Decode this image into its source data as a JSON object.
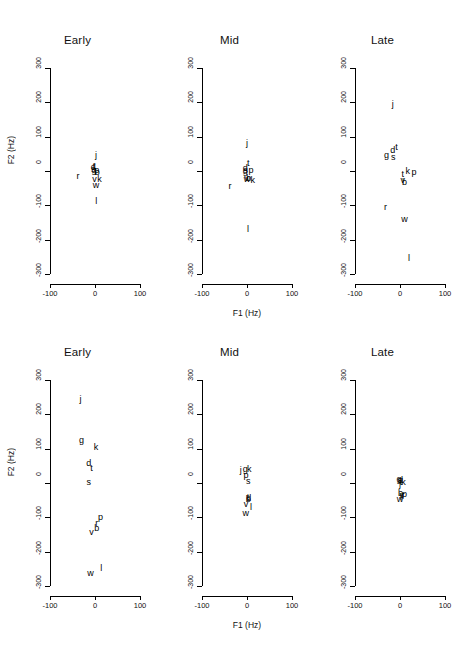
{
  "figure": {
    "axis": {
      "xlabel": "F1 (Hz)",
      "ylabel": "F2 (Hz)",
      "xticks": [
        "-100",
        "0",
        "100"
      ],
      "xtick_values": [
        -100,
        0,
        100
      ],
      "yticks": [
        "300",
        "200",
        "100",
        "0",
        "-100",
        "-200",
        "-300"
      ],
      "ytick_values": [
        300,
        200,
        100,
        0,
        -100,
        -200,
        -300
      ],
      "xlim": [
        -100,
        100
      ],
      "ylim": [
        -300,
        300
      ]
    }
  },
  "chart_data": [
    {
      "type": "scatter",
      "title": "Early",
      "row": 0,
      "col": 0,
      "xlabel": "F1 (Hz)",
      "ylabel": "F2 (Hz)",
      "xlim": [
        -100,
        100
      ],
      "ylim": [
        -300,
        300
      ],
      "grid": false,
      "marker_style": "text-label",
      "points": [
        {
          "label": "j",
          "x": 2,
          "y": 48
        },
        {
          "label": "d",
          "x": -4,
          "y": 12
        },
        {
          "label": "t",
          "x": -2,
          "y": 16
        },
        {
          "label": "s",
          "x": -4,
          "y": 6
        },
        {
          "label": "g",
          "x": -2,
          "y": 4
        },
        {
          "label": "p",
          "x": 4,
          "y": 2
        },
        {
          "label": "b",
          "x": 5,
          "y": -2
        },
        {
          "label": "r",
          "x": -38,
          "y": -16
        },
        {
          "label": "v",
          "x": -1,
          "y": -22
        },
        {
          "label": "k",
          "x": 10,
          "y": -24
        },
        {
          "label": "w",
          "x": 2,
          "y": -40
        },
        {
          "label": "l",
          "x": 3,
          "y": -88
        }
      ]
    },
    {
      "type": "scatter",
      "title": "Mid",
      "row": 0,
      "col": 1,
      "xlabel": "F1 (Hz)",
      "ylabel": "F2 (Hz)",
      "xlim": [
        -100,
        100
      ],
      "ylim": [
        -300,
        300
      ],
      "grid": false,
      "marker_style": "text-label",
      "points": [
        {
          "label": "j",
          "x": 0,
          "y": 82
        },
        {
          "label": "t",
          "x": 3,
          "y": 22
        },
        {
          "label": "d",
          "x": -4,
          "y": 10
        },
        {
          "label": "s",
          "x": -3,
          "y": 4
        },
        {
          "label": "g",
          "x": -4,
          "y": 0
        },
        {
          "label": "p",
          "x": 9,
          "y": 2
        },
        {
          "label": "v",
          "x": -1,
          "y": -20
        },
        {
          "label": "b",
          "x": 4,
          "y": -20
        },
        {
          "label": "k",
          "x": 13,
          "y": -26
        },
        {
          "label": "w",
          "x": 0,
          "y": -22
        },
        {
          "label": "r",
          "x": -38,
          "y": -44
        },
        {
          "label": "l",
          "x": 2,
          "y": -170
        }
      ]
    },
    {
      "type": "scatter",
      "title": "Late",
      "row": 0,
      "col": 2,
      "xlabel": "F1 (Hz)",
      "ylabel": "F2 (Hz)",
      "xlim": [
        -100,
        100
      ],
      "ylim": [
        -300,
        300
      ],
      "grid": false,
      "marker_style": "text-label",
      "points": [
        {
          "label": "j",
          "x": -16,
          "y": 196
        },
        {
          "label": "g",
          "x": -30,
          "y": 48
        },
        {
          "label": "d",
          "x": -16,
          "y": 60
        },
        {
          "label": "t",
          "x": -8,
          "y": 70
        },
        {
          "label": "s",
          "x": -15,
          "y": 40
        },
        {
          "label": "t",
          "x": 6,
          "y": -8
        },
        {
          "label": "k",
          "x": 17,
          "y": 0
        },
        {
          "label": "p",
          "x": 31,
          "y": -2
        },
        {
          "label": "b",
          "x": 10,
          "y": -32
        },
        {
          "label": "v",
          "x": 6,
          "y": -26
        },
        {
          "label": "r",
          "x": -32,
          "y": -104
        },
        {
          "label": "w",
          "x": 10,
          "y": -140
        },
        {
          "label": "l",
          "x": 20,
          "y": -252
        }
      ]
    },
    {
      "type": "scatter",
      "title": "Early",
      "row": 1,
      "col": 0,
      "xlabel": "F1 (Hz)",
      "ylabel": "F2 (Hz)",
      "xlim": [
        -100,
        100
      ],
      "ylim": [
        -300,
        300
      ],
      "grid": false,
      "marker_style": "text-label",
      "points": [
        {
          "label": "j",
          "x": -32,
          "y": 244
        },
        {
          "label": "g",
          "x": -30,
          "y": 124
        },
        {
          "label": "k",
          "x": 2,
          "y": 104
        },
        {
          "label": "d",
          "x": -14,
          "y": 58
        },
        {
          "label": "t",
          "x": -8,
          "y": 44
        },
        {
          "label": "s",
          "x": -14,
          "y": 2
        },
        {
          "label": "p",
          "x": 12,
          "y": -100
        },
        {
          "label": "r",
          "x": 4,
          "y": -116
        },
        {
          "label": "b",
          "x": 4,
          "y": -130
        },
        {
          "label": "v",
          "x": -8,
          "y": -144
        },
        {
          "label": "w",
          "x": -10,
          "y": -262
        },
        {
          "label": "l",
          "x": 14,
          "y": -248
        }
      ]
    },
    {
      "type": "scatter",
      "title": "Mid",
      "row": 1,
      "col": 1,
      "xlabel": "F1 (Hz)",
      "ylabel": "F2 (Hz)",
      "xlim": [
        -100,
        100
      ],
      "ylim": [
        -300,
        300
      ],
      "grid": false,
      "marker_style": "text-label",
      "points": [
        {
          "label": "j",
          "x": -14,
          "y": 38
        },
        {
          "label": "g",
          "x": -4,
          "y": 42
        },
        {
          "label": "k",
          "x": 5,
          "y": 42
        },
        {
          "label": "p",
          "x": -2,
          "y": 24
        },
        {
          "label": "s",
          "x": 3,
          "y": 6
        },
        {
          "label": "t",
          "x": 2,
          "y": -42
        },
        {
          "label": "d",
          "x": 4,
          "y": -44
        },
        {
          "label": "b",
          "x": 3,
          "y": -48
        },
        {
          "label": "v",
          "x": -2,
          "y": -62
        },
        {
          "label": "l",
          "x": 9,
          "y": -70
        },
        {
          "label": "w",
          "x": -3,
          "y": -88
        }
      ]
    },
    {
      "type": "scatter",
      "title": "Late",
      "row": 1,
      "col": 2,
      "xlabel": "F1 (Hz)",
      "ylabel": "F2 (Hz)",
      "xlim": [
        -100,
        100
      ],
      "ylim": [
        -300,
        300
      ],
      "grid": false,
      "marker_style": "text-label",
      "points": [
        {
          "label": "g",
          "x": -2,
          "y": 12
        },
        {
          "label": "s",
          "x": -1,
          "y": 10
        },
        {
          "label": "d",
          "x": 1,
          "y": 8
        },
        {
          "label": "t",
          "x": 2,
          "y": 4
        },
        {
          "label": "k",
          "x": 8,
          "y": 2
        },
        {
          "label": "j",
          "x": 0,
          "y": -2
        },
        {
          "label": "b",
          "x": 1,
          "y": -30
        },
        {
          "label": "p",
          "x": 10,
          "y": -32
        },
        {
          "label": "v",
          "x": 4,
          "y": -34
        },
        {
          "label": "l",
          "x": 2,
          "y": -40
        },
        {
          "label": "w",
          "x": 0,
          "y": -48
        },
        {
          "label": "r",
          "x": 7,
          "y": -36
        }
      ]
    }
  ]
}
